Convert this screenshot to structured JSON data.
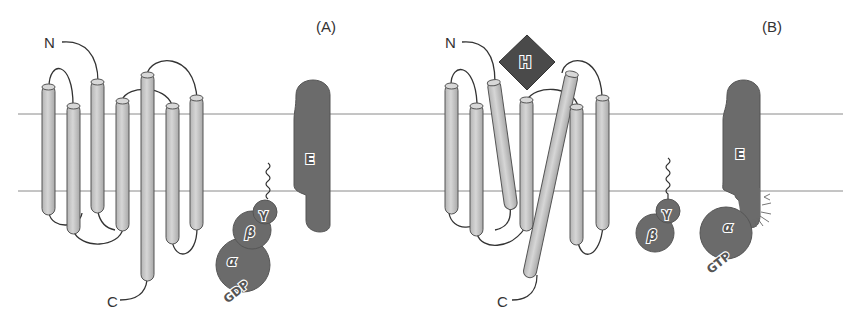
{
  "panels": [
    {
      "id": "A",
      "label": "(A)",
      "receptor": {
        "n_terminus": "N",
        "c_terminus": "C",
        "helix_count": 7,
        "state": "inactive"
      },
      "effector": {
        "label": "E"
      },
      "g_protein": {
        "subunits": [
          {
            "name": "gamma",
            "label": "γ"
          },
          {
            "name": "beta",
            "label": "β"
          },
          {
            "name": "alpha",
            "label": "α"
          }
        ],
        "nucleotide": "GDP",
        "state": "trimer-bound"
      }
    },
    {
      "id": "B",
      "label": "(B)",
      "ligand": {
        "label": "H"
      },
      "receptor": {
        "n_terminus": "N",
        "c_terminus": "C",
        "helix_count": 7,
        "state": "active"
      },
      "effector": {
        "label": "E"
      },
      "g_protein": {
        "subunits": [
          {
            "name": "gamma",
            "label": "γ"
          },
          {
            "name": "beta",
            "label": "β"
          },
          {
            "name": "alpha",
            "label": "α"
          }
        ],
        "nucleotide": "GTP",
        "state": "dissociated"
      }
    }
  ],
  "colors": {
    "helix_fill": "#c8c8c8",
    "helix_stroke": "#555555",
    "protein_fill": "#6b6b6b",
    "ligand_fill": "#4a4a4a",
    "membrane_line": "#8a8a8a",
    "loop": "#333333"
  }
}
